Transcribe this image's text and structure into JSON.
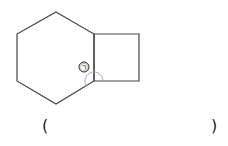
{
  "figure": {
    "shapes": [
      "regular-hexagon",
      "square"
    ],
    "angle_label": "㉠",
    "stroke_color": "#444444",
    "arc_color": "#aaaaaa"
  },
  "answer": {
    "open_paren": "(",
    "close_paren": ")",
    "value": ""
  }
}
